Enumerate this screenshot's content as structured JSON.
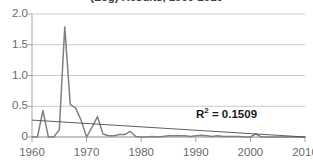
{
  "chart_data": {
    "type": "line",
    "title": "(Log) Results, 1960-2010",
    "xlabel": "",
    "ylabel": "",
    "xlim": [
      1960,
      2010
    ],
    "ylim": [
      0,
      2.0
    ],
    "grid": true,
    "legend": false,
    "y_ticks": [
      "0",
      "0.5",
      "1.0",
      "1.5",
      "2.0"
    ],
    "y_tick_values": [
      0,
      0.5,
      1.0,
      1.5,
      2.0
    ],
    "x_ticks": [
      "1960",
      "1970",
      "1980",
      "1990",
      "2000",
      "2010"
    ],
    "x_tick_values": [
      1960,
      1970,
      1980,
      1990,
      2000,
      2010
    ],
    "series": [
      {
        "name": "data",
        "color": "#808080",
        "x": [
          1960,
          1961,
          1962,
          1963,
          1964,
          1965,
          1966,
          1967,
          1968,
          1969,
          1970,
          1971,
          1972,
          1973,
          1974,
          1975,
          1976,
          1977,
          1978,
          1979,
          1980,
          1981,
          1982,
          1983,
          1984,
          1985,
          1986,
          1987,
          1988,
          1989,
          1990,
          1991,
          1992,
          1993,
          1994,
          1995,
          1996,
          1997,
          1998,
          1999,
          2000,
          2001,
          2002,
          2003,
          2004,
          2005,
          2006,
          2007,
          2008,
          2009,
          2010
        ],
        "values": [
          0.0,
          0.0,
          0.43,
          0.0,
          0.0,
          0.12,
          1.79,
          0.53,
          0.47,
          0.27,
          0.0,
          0.16,
          0.33,
          0.05,
          0.02,
          0.02,
          0.04,
          0.04,
          0.09,
          0.01,
          0.0,
          0.0,
          0.01,
          0.0,
          0.01,
          0.02,
          0.02,
          0.02,
          0.02,
          0.01,
          0.02,
          0.03,
          0.02,
          0.01,
          0.02,
          0.01,
          0.01,
          0.01,
          0.01,
          0.0,
          0.0,
          0.05,
          0.0,
          0.0,
          0.0,
          0.0,
          0.0,
          0.0,
          0.0,
          0.0,
          0.0
        ]
      },
      {
        "name": "trendline",
        "color": "#4d4d4d",
        "x": [
          1960,
          2010
        ],
        "values": [
          0.275,
          0.0
        ]
      }
    ],
    "annotations": [
      {
        "name": "r2-annotation",
        "text_prefix": "R",
        "text_sup": "2",
        "text_suffix": " = 0.1509",
        "value": 0.1509
      }
    ]
  }
}
